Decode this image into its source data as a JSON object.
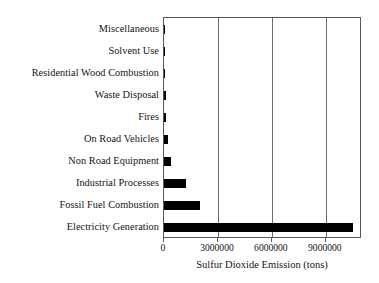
{
  "chart_data": {
    "type": "bar",
    "orientation": "horizontal",
    "title": "",
    "xlabel": "Sulfur Dioxide Emission (tons)",
    "ylabel": "",
    "categories": [
      "Miscellaneous",
      "Solvent Use",
      "Residential Wood Combustion",
      "Waste Disposal",
      "Fires",
      "On Road Vehicles",
      "Non Road Equipment",
      "Industrial Processes",
      "Fossil Fuel Combustion",
      "Electricity Generation"
    ],
    "values": [
      3000,
      6000,
      20000,
      110000,
      120000,
      230000,
      400000,
      1230000,
      2000000,
      10500000
    ],
    "xlim": [
      0,
      10900000
    ],
    "xticks": [
      0,
      3000000,
      6000000,
      9000000
    ],
    "xticklabels": [
      "0",
      "3000000",
      "6000000",
      "9000000"
    ],
    "grid": "vertical",
    "legend": "none",
    "bar_color": "#000000",
    "frame_color": "#55585c"
  }
}
